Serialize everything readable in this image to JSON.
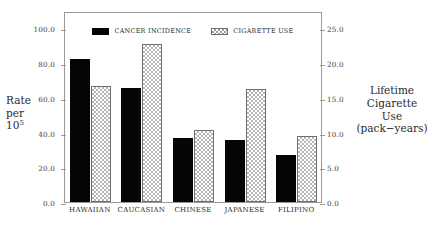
{
  "chart_data": {
    "type": "bar",
    "title": "",
    "categories": [
      "HAWAIIAN",
      "CAUCASIAN",
      "CHINESE",
      "JAPANESE",
      "FILIPINO"
    ],
    "series": [
      {
        "name": "CANCER INCIDENCE",
        "axis": "left",
        "style": "solid-black",
        "color": "#050505",
        "values": [
          82.5,
          65.5,
          37.0,
          36.0,
          27.0
        ]
      },
      {
        "name": "CIGARETTE USE",
        "axis": "right",
        "style": "checkered-hatch",
        "color": "#b6b6b6",
        "values": [
          16.7,
          22.7,
          10.4,
          16.2,
          9.5
        ]
      }
    ],
    "xlabel": "",
    "ylabel": "Rate per 10⁵",
    "ylabel_lines": [
      "Rate",
      "per",
      "10"
    ],
    "ylabel_superscript": "5",
    "ylim": [
      0,
      110
    ],
    "yticks": [
      0.0,
      20.0,
      40.0,
      60.0,
      80.0,
      100.0
    ],
    "yticklabels": [
      "0.0",
      "20.0",
      "40.0",
      "60.0",
      "80.0",
      "100.0"
    ],
    "y2label": "Lifetime Cigarette Use (pack−years)",
    "y2label_lines": [
      "Lifetime",
      "Cigarette",
      "Use",
      "(pack−years)"
    ],
    "y2lim": [
      0,
      27.5
    ],
    "y2ticks": [
      0.0,
      5.0,
      10.0,
      15.0,
      20.0,
      25.0
    ],
    "y2ticklabels": [
      "0.0",
      "5.0",
      "10.0",
      "15.0",
      "20.0",
      "25.0"
    ],
    "grid": false,
    "legend_position": "top-center",
    "legend": [
      "CANCER INCIDENCE",
      "CIGARETTE USE"
    ]
  },
  "legend": {
    "entries": [
      {
        "label": "CANCER INCIDENCE",
        "swatch": "solid-black-swatch"
      },
      {
        "label": "CIGARETTE USE",
        "swatch": "hatched-swatch"
      }
    ]
  },
  "axes": {
    "left": {
      "title_lines": [
        "Rate",
        "per",
        "10"
      ],
      "title_sup": "5",
      "ticklabels": [
        "0.0",
        "20.0",
        "40.0",
        "60.0",
        "80.0",
        "100.0"
      ]
    },
    "right": {
      "title_lines": [
        "Lifetime",
        "Cigarette",
        "Use",
        "(pack−years)"
      ],
      "ticklabels": [
        "0.0",
        "5.0",
        "10.0",
        "15.0",
        "20.0",
        "25.0"
      ]
    },
    "x": {
      "ticklabels": [
        "HAWAIIAN",
        "CAUCASIAN",
        "CHINESE",
        "JAPANESE",
        "FILIPINO"
      ]
    }
  }
}
